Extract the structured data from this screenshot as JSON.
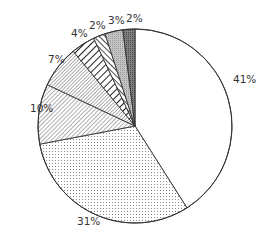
{
  "chart_data": {
    "type": "pie",
    "title": "",
    "start_angle_deg": 0,
    "direction": "clockwise",
    "legend": "none",
    "center": [
      135,
      126
    ],
    "radius": 97,
    "slices": [
      {
        "label": "41%",
        "value": 41,
        "pattern": "white",
        "label_pos": [
          233,
          83
        ]
      },
      {
        "label": "31%",
        "value": 31,
        "pattern": "dots",
        "label_pos": [
          77,
          225
        ]
      },
      {
        "label": "10%",
        "value": 10,
        "pattern": "hatch-fine",
        "label_pos": [
          30,
          112
        ]
      },
      {
        "label": "7%",
        "value": 7,
        "pattern": "hatch-dense",
        "label_pos": [
          48,
          63
        ]
      },
      {
        "label": "4%",
        "value": 4,
        "pattern": "stripes-wide",
        "label_pos": [
          71,
          37
        ]
      },
      {
        "label": "2%",
        "value": 2,
        "pattern": "stripes-narrow",
        "label_pos": [
          89,
          29
        ]
      },
      {
        "label": "3%",
        "value": 3,
        "pattern": "gray-light",
        "label_pos": [
          108,
          24
        ]
      },
      {
        "label": "2%",
        "value": 2,
        "pattern": "gray-dark",
        "label_pos": [
          126,
          22
        ]
      }
    ]
  }
}
